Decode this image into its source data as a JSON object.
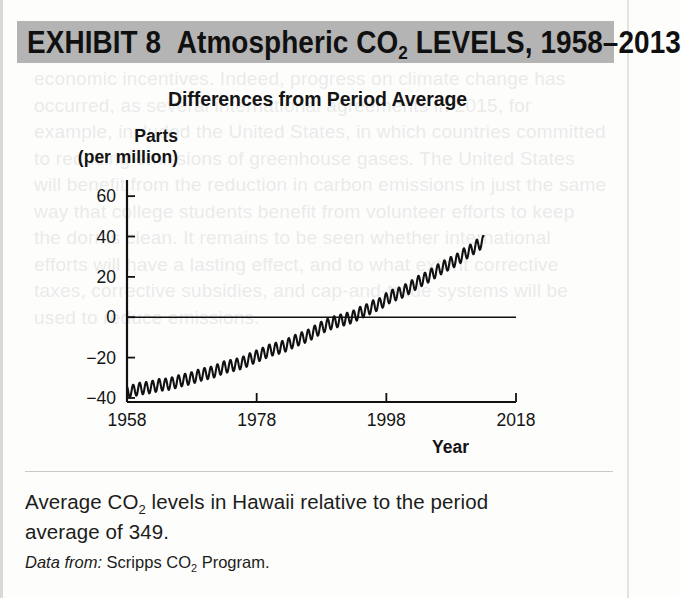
{
  "exhibit": {
    "banner_label": "EXHIBIT 8",
    "banner_title_pre": "Atmospheric CO",
    "banner_title_sub": "2",
    "banner_title_post": " LEVELS, 1958–2013",
    "banner_bg": "#b4b4b4",
    "banner_full_text": "EXHIBIT 8  Atmospheric CO2 LEVELS, 1958–2013"
  },
  "caption": {
    "text_pre": "Average CO",
    "text_sub": "2",
    "text_post": " levels in Hawaii relative to the period average of 349.",
    "full_text": "Average CO2 levels in Hawaii relative to the period average of 349.",
    "source_label": "Data from:",
    "source_pre": " Scripps CO",
    "source_sub": "2",
    "source_post": " Program.",
    "source_full": "Data from: Scripps CO2 Program."
  },
  "chart_data": {
    "type": "line",
    "title": "Differences from Period Average",
    "xlabel": "Year",
    "ylabel_line1": "Parts",
    "ylabel_line2": "(per million)",
    "ylabel": "Parts (per million)",
    "xlim": [
      1958,
      2018
    ],
    "ylim": [
      -42,
      68
    ],
    "xticks": [
      1958,
      1978,
      1998,
      2018
    ],
    "yticks": [
      60,
      40,
      20,
      0,
      -20,
      -40
    ],
    "ytick_labels": [
      "60",
      "40",
      "20",
      "0",
      "−20",
      "−40"
    ],
    "grid": false,
    "legend": null,
    "zero_reference_line": 0,
    "period_average_ppm": 349,
    "line_color": "#111111",
    "series": [
      {
        "name": "CO2 difference from period average",
        "x": [
          1958,
          1959,
          1960,
          1961,
          1962,
          1963,
          1964,
          1965,
          1966,
          1967,
          1968,
          1969,
          1970,
          1971,
          1972,
          1973,
          1974,
          1975,
          1976,
          1977,
          1978,
          1979,
          1980,
          1981,
          1982,
          1983,
          1984,
          1985,
          1986,
          1987,
          1988,
          1989,
          1990,
          1991,
          1992,
          1993,
          1994,
          1995,
          1996,
          1997,
          1998,
          1999,
          2000,
          2001,
          2002,
          2003,
          2004,
          2005,
          2006,
          2007,
          2008,
          2009,
          2010,
          2011,
          2012,
          2013
        ],
        "values": [
          -37.2,
          -36.3,
          -35.4,
          -35.0,
          -34.4,
          -33.5,
          -33.3,
          -32.7,
          -31.6,
          -30.9,
          -30.1,
          -28.9,
          -28.0,
          -27.4,
          -26.2,
          -24.7,
          -24.1,
          -23.3,
          -22.3,
          -20.7,
          -19.3,
          -18.0,
          -16.4,
          -15.5,
          -14.7,
          -13.2,
          -11.6,
          -10.3,
          -9.0,
          -7.0,
          -5.1,
          -3.6,
          -2.4,
          -1.5,
          -0.7,
          0.5,
          2.3,
          3.6,
          5.5,
          6.6,
          9.1,
          10.8,
          11.9,
          13.5,
          15.5,
          17.7,
          19.2,
          21.3,
          23.4,
          25.3,
          27.0,
          28.7,
          31.3,
          33.1,
          35.6,
          37.4
        ]
      }
    ],
    "seasonal_oscillation_amplitude": 3.0,
    "end_value_approx": 56,
    "start_value_approx": -37,
    "zero_crossing_year_approx": 1993
  }
}
